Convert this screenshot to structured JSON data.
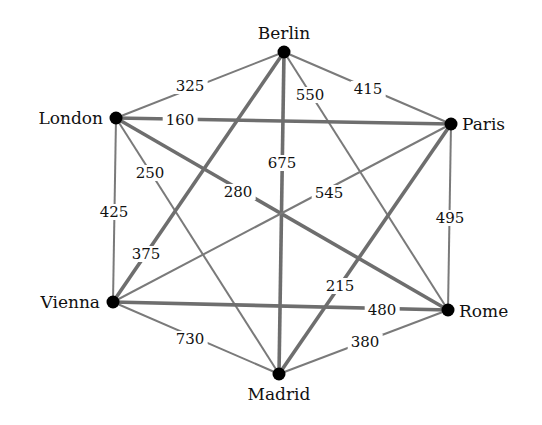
{
  "nodes": [
    {
      "id": "berlin",
      "name": "Berlin",
      "x": 284,
      "y": 52,
      "lx": 284,
      "ly": 33,
      "anchor": "center"
    },
    {
      "id": "london",
      "name": "London",
      "x": 116,
      "y": 118,
      "lx": 103,
      "ly": 118,
      "anchor": "right"
    },
    {
      "id": "paris",
      "name": "Paris",
      "x": 451,
      "y": 124,
      "lx": 462,
      "ly": 124,
      "anchor": "left"
    },
    {
      "id": "vienna",
      "name": "Vienna",
      "x": 113,
      "y": 302,
      "lx": 100,
      "ly": 302,
      "anchor": "right"
    },
    {
      "id": "rome",
      "name": "Rome",
      "x": 448,
      "y": 310,
      "lx": 459,
      "ly": 311,
      "anchor": "left"
    },
    {
      "id": "madrid",
      "name": "Madrid",
      "x": 279,
      "y": 374,
      "lx": 279,
      "ly": 394,
      "anchor": "center"
    }
  ],
  "edges": [
    {
      "from": "london",
      "to": "berlin",
      "weight": "325",
      "thick": false,
      "lx": 190,
      "ly": 86
    },
    {
      "from": "berlin",
      "to": "paris",
      "weight": "415",
      "thick": false,
      "lx": 368,
      "ly": 89
    },
    {
      "from": "berlin",
      "to": "rome",
      "weight": "550",
      "thick": false,
      "lx": 310,
      "ly": 95
    },
    {
      "from": "london",
      "to": "paris",
      "weight": "160",
      "thick": true,
      "lx": 180,
      "ly": 120
    },
    {
      "from": "london",
      "to": "madrid",
      "weight": "250",
      "thick": false,
      "lx": 150,
      "ly": 173
    },
    {
      "from": "london",
      "to": "rome",
      "weight": "280",
      "thick": true,
      "lx": 238,
      "ly": 192
    },
    {
      "from": "berlin",
      "to": "madrid",
      "weight": "675",
      "thick": true,
      "lx": 282,
      "ly": 163
    },
    {
      "from": "vienna",
      "to": "paris",
      "weight": "545",
      "thick": false,
      "lx": 329,
      "ly": 193
    },
    {
      "from": "london",
      "to": "vienna",
      "weight": "425",
      "thick": false,
      "lx": 114,
      "ly": 212
    },
    {
      "from": "paris",
      "to": "rome",
      "weight": "495",
      "thick": false,
      "lx": 450,
      "ly": 218
    },
    {
      "from": "berlin",
      "to": "vienna",
      "weight": "375",
      "thick": true,
      "lx": 146,
      "ly": 254
    },
    {
      "from": "paris",
      "to": "madrid",
      "weight": "215",
      "thick": true,
      "lx": 340,
      "ly": 286
    },
    {
      "from": "vienna",
      "to": "rome",
      "weight": "480",
      "thick": true,
      "lx": 382,
      "ly": 310
    },
    {
      "from": "vienna",
      "to": "madrid",
      "weight": "730",
      "thick": false,
      "lx": 190,
      "ly": 339
    },
    {
      "from": "madrid",
      "to": "rome",
      "weight": "380",
      "thick": false,
      "lx": 365,
      "ly": 342
    }
  ]
}
